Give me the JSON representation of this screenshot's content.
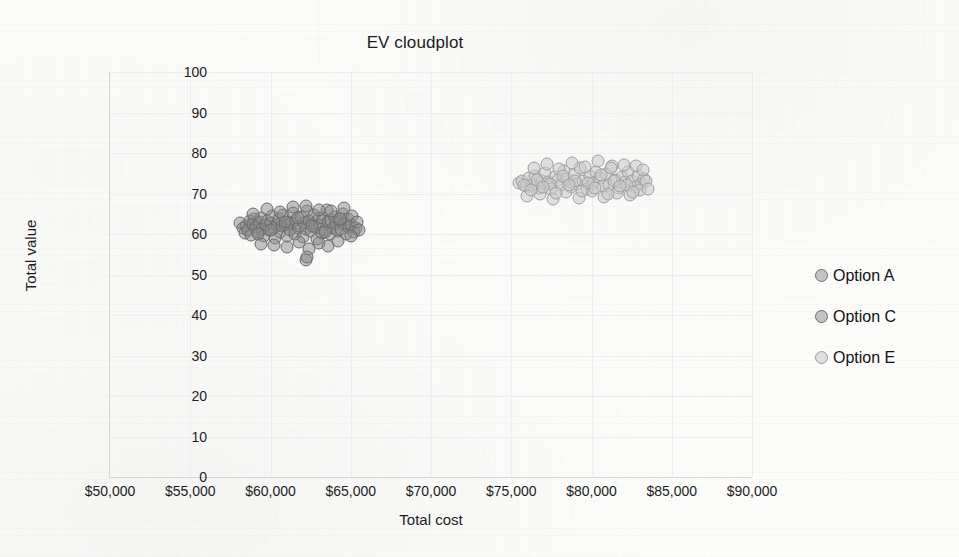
{
  "chart_data": {
    "type": "scatter",
    "title": "EV cloudplot",
    "xlabel": "Total cost",
    "ylabel": "Total value",
    "xlim": [
      50000,
      90000
    ],
    "ylim": [
      0,
      100
    ],
    "grid": true,
    "legend_position": "right",
    "x_ticks": [
      "$50,000",
      "$55,000",
      "$60,000",
      "$65,000",
      "$70,000",
      "$75,000",
      "$80,000",
      "$85,000",
      "$90,000"
    ],
    "x_tick_values": [
      50000,
      55000,
      60000,
      65000,
      70000,
      75000,
      80000,
      85000,
      90000
    ],
    "y_ticks": [
      "0",
      "10",
      "20",
      "30",
      "40",
      "50",
      "60",
      "70",
      "80",
      "90",
      "100"
    ],
    "y_tick_values": [
      0,
      10,
      20,
      30,
      40,
      50,
      60,
      70,
      80,
      90,
      100
    ],
    "series": [
      {
        "name": "Option A",
        "color": "#a8a8a8",
        "marker_fill": "rgba(150,150,150,0.55)",
        "marker_edge": "#6f6f6f",
        "points": []
      },
      {
        "name": "Option C",
        "color": "#9a9a9a",
        "marker_fill": "rgba(138,138,138,0.50)",
        "marker_edge": "#6b6b6b",
        "x_range": [
          58000,
          65600
        ],
        "y_range": [
          53,
          67
        ],
        "points": [
          [
            58100,
            62.8
          ],
          [
            58300,
            61.4
          ],
          [
            58500,
            62.0
          ],
          [
            58400,
            60.2
          ],
          [
            58700,
            63.1
          ],
          [
            58600,
            61.0
          ],
          [
            58900,
            62.4
          ],
          [
            58800,
            59.8
          ],
          [
            59000,
            63.6
          ],
          [
            59100,
            61.8
          ],
          [
            59200,
            60.6
          ],
          [
            59300,
            62.9
          ],
          [
            59400,
            64.0
          ],
          [
            59500,
            61.2
          ],
          [
            59600,
            59.4
          ],
          [
            59700,
            62.2
          ],
          [
            59800,
            63.3
          ],
          [
            59900,
            60.9
          ],
          [
            60000,
            62.6
          ],
          [
            60100,
            64.4
          ],
          [
            60200,
            61.6
          ],
          [
            60300,
            59.0
          ],
          [
            60400,
            62.1
          ],
          [
            60500,
            63.8
          ],
          [
            60600,
            60.4
          ],
          [
            60700,
            61.9
          ],
          [
            60800,
            64.8
          ],
          [
            60900,
            62.3
          ],
          [
            61000,
            59.6
          ],
          [
            61100,
            63.0
          ],
          [
            61200,
            61.1
          ],
          [
            61300,
            62.7
          ],
          [
            61400,
            65.1
          ],
          [
            61500,
            60.1
          ],
          [
            61600,
            63.4
          ],
          [
            61700,
            61.5
          ],
          [
            61800,
            62.0
          ],
          [
            61900,
            64.2
          ],
          [
            62000,
            59.2
          ],
          [
            62100,
            62.8
          ],
          [
            62200,
            61.3
          ],
          [
            62300,
            65.6
          ],
          [
            62400,
            63.2
          ],
          [
            62500,
            60.7
          ],
          [
            62600,
            62.5
          ],
          [
            62700,
            64.6
          ],
          [
            62800,
            61.7
          ],
          [
            62900,
            58.8
          ],
          [
            63000,
            63.9
          ],
          [
            63100,
            62.2
          ],
          [
            63200,
            60.3
          ],
          [
            63300,
            64.0
          ],
          [
            63400,
            61.0
          ],
          [
            63500,
            65.9
          ],
          [
            63600,
            62.9
          ],
          [
            63700,
            59.9
          ],
          [
            63800,
            63.5
          ],
          [
            63900,
            61.4
          ],
          [
            64000,
            64.3
          ],
          [
            64100,
            62.6
          ],
          [
            64200,
            60.8
          ],
          [
            64300,
            63.1
          ],
          [
            64400,
            61.2
          ],
          [
            64500,
            64.9
          ],
          [
            64600,
            62.4
          ],
          [
            64700,
            60.0
          ],
          [
            64800,
            63.7
          ],
          [
            64900,
            61.8
          ],
          [
            65000,
            62.1
          ],
          [
            65100,
            64.5
          ],
          [
            65200,
            60.5
          ],
          [
            65300,
            61.6
          ],
          [
            65400,
            62.9
          ],
          [
            65500,
            61.1
          ],
          [
            59400,
            57.6
          ],
          [
            60200,
            57.2
          ],
          [
            61000,
            56.8
          ],
          [
            61800,
            58.0
          ],
          [
            62400,
            56.4
          ],
          [
            63000,
            57.8
          ],
          [
            63600,
            57.0
          ],
          [
            64200,
            58.2
          ],
          [
            62200,
            53.6
          ],
          [
            62300,
            54.4
          ],
          [
            58900,
            65.0
          ],
          [
            59800,
            66.2
          ],
          [
            60600,
            65.4
          ],
          [
            61400,
            66.6
          ],
          [
            62200,
            67.0
          ],
          [
            63000,
            66.0
          ],
          [
            63800,
            65.6
          ],
          [
            64600,
            66.4
          ],
          [
            59200,
            60.0
          ],
          [
            60000,
            61.0
          ],
          [
            60900,
            63.0
          ],
          [
            61700,
            64.0
          ],
          [
            62600,
            62.0
          ],
          [
            63400,
            60.5
          ],
          [
            64300,
            63.6
          ],
          [
            65000,
            59.6
          ]
        ]
      },
      {
        "name": "Option E",
        "color": "#cfcfcf",
        "marker_fill": "rgba(200,200,200,0.55)",
        "marker_edge": "#9d9d9d",
        "x_range": [
          75400,
          83600
        ],
        "y_range": [
          68,
          78
        ],
        "points": [
          [
            75500,
            72.6
          ],
          [
            75700,
            73.0
          ],
          [
            75900,
            71.8
          ],
          [
            76100,
            73.8
          ],
          [
            76300,
            72.2
          ],
          [
            76500,
            74.4
          ],
          [
            76700,
            71.4
          ],
          [
            76900,
            73.2
          ],
          [
            77100,
            75.0
          ],
          [
            77300,
            72.8
          ],
          [
            77500,
            71.0
          ],
          [
            77700,
            74.0
          ],
          [
            77900,
            73.4
          ],
          [
            78100,
            72.0
          ],
          [
            78300,
            75.6
          ],
          [
            78500,
            73.6
          ],
          [
            78700,
            71.6
          ],
          [
            78900,
            74.6
          ],
          [
            79100,
            72.4
          ],
          [
            79300,
            76.2
          ],
          [
            79500,
            73.0
          ],
          [
            79700,
            71.2
          ],
          [
            79900,
            74.2
          ],
          [
            80100,
            72.6
          ],
          [
            80300,
            75.2
          ],
          [
            80500,
            73.8
          ],
          [
            80700,
            71.8
          ],
          [
            80900,
            74.8
          ],
          [
            81100,
            72.2
          ],
          [
            81300,
            76.8
          ],
          [
            81500,
            73.4
          ],
          [
            81700,
            71.4
          ],
          [
            81900,
            74.0
          ],
          [
            82100,
            72.8
          ],
          [
            82300,
            75.4
          ],
          [
            82500,
            73.2
          ],
          [
            82700,
            71.6
          ],
          [
            82900,
            74.4
          ],
          [
            83100,
            72.4
          ],
          [
            83300,
            73.6
          ],
          [
            76000,
            69.4
          ],
          [
            76800,
            70.0
          ],
          [
            77600,
            68.6
          ],
          [
            78400,
            70.4
          ],
          [
            79200,
            69.0
          ],
          [
            80000,
            70.6
          ],
          [
            80800,
            69.2
          ],
          [
            81600,
            70.2
          ],
          [
            82400,
            69.6
          ],
          [
            83000,
            70.8
          ],
          [
            76400,
            76.4
          ],
          [
            77200,
            77.2
          ],
          [
            78000,
            76.0
          ],
          [
            78800,
            77.6
          ],
          [
            79600,
            76.6
          ],
          [
            80400,
            78.0
          ],
          [
            81200,
            76.2
          ],
          [
            82000,
            77.0
          ],
          [
            82800,
            76.8
          ],
          [
            83200,
            75.8
          ],
          [
            75800,
            72.0
          ],
          [
            76600,
            73.4
          ],
          [
            77400,
            72.4
          ],
          [
            78200,
            74.2
          ],
          [
            79000,
            73.0
          ],
          [
            79800,
            72.6
          ],
          [
            80600,
            74.6
          ],
          [
            81400,
            73.2
          ],
          [
            82200,
            72.0
          ],
          [
            83400,
            73.0
          ],
          [
            76200,
            70.8
          ],
          [
            77000,
            71.6
          ],
          [
            77800,
            70.2
          ],
          [
            78600,
            72.0
          ],
          [
            79400,
            70.6
          ],
          [
            80200,
            71.4
          ],
          [
            81000,
            70.0
          ],
          [
            81800,
            71.8
          ],
          [
            82600,
            70.4
          ],
          [
            83500,
            71.2
          ]
        ]
      }
    ]
  }
}
